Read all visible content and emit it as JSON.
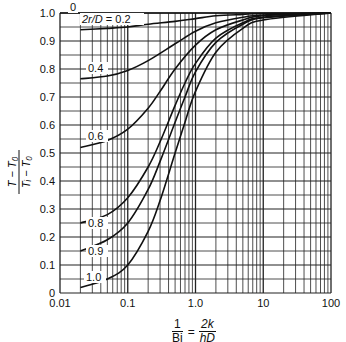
{
  "chart_data": {
    "type": "line",
    "title": "",
    "xlabel": "1/Bi = 2k/hD",
    "ylabel": "(T - T0)/(Ti - T0)",
    "xscale": "log",
    "xlim": [
      0.01,
      100
    ],
    "ylim": [
      0,
      1.0
    ],
    "grid": true,
    "legend": "inline curve labels",
    "x_tick_labels": [
      "0.01",
      "0.1",
      "1.0",
      "10",
      "100"
    ],
    "y_tick_labels": [
      "0",
      "0.1",
      "0.2",
      "0.3",
      "0.4",
      "0.5",
      "0.6",
      "0.7",
      "0.8",
      "0.9",
      "1.0"
    ],
    "series_parameter": "2r/D",
    "series": [
      {
        "name": "0",
        "label": "0",
        "x": [
          0.01,
          100
        ],
        "y": [
          1.0,
          1.0
        ]
      },
      {
        "name": "0.2",
        "label": "2r/D = 0.2",
        "x": [
          0.02,
          0.05,
          0.1,
          0.2,
          0.5,
          1,
          2,
          5,
          10,
          100
        ],
        "y": [
          0.94,
          0.945,
          0.95,
          0.96,
          0.97,
          0.98,
          0.99,
          0.995,
          0.998,
          1.0
        ]
      },
      {
        "name": "0.4",
        "label": "0.4",
        "x": [
          0.02,
          0.05,
          0.1,
          0.2,
          0.5,
          1,
          2,
          5,
          10,
          100
        ],
        "y": [
          0.765,
          0.775,
          0.795,
          0.83,
          0.89,
          0.935,
          0.965,
          0.985,
          0.993,
          1.0
        ]
      },
      {
        "name": "0.6",
        "label": "0.6",
        "x": [
          0.02,
          0.05,
          0.1,
          0.2,
          0.3,
          0.5,
          1,
          2,
          5,
          10,
          100
        ],
        "y": [
          0.52,
          0.545,
          0.585,
          0.66,
          0.72,
          0.8,
          0.885,
          0.94,
          0.975,
          0.99,
          1.0
        ]
      },
      {
        "name": "0.8",
        "label": "0.8",
        "x": [
          0.02,
          0.05,
          0.1,
          0.2,
          0.3,
          0.5,
          0.7,
          1,
          2,
          5,
          10,
          100
        ],
        "y": [
          0.25,
          0.28,
          0.34,
          0.45,
          0.54,
          0.67,
          0.75,
          0.82,
          0.91,
          0.965,
          0.985,
          1.0
        ]
      },
      {
        "name": "0.9",
        "label": "0.9",
        "x": [
          0.02,
          0.05,
          0.1,
          0.2,
          0.3,
          0.5,
          0.7,
          1,
          2,
          5,
          10,
          100
        ],
        "y": [
          0.15,
          0.19,
          0.25,
          0.37,
          0.47,
          0.61,
          0.7,
          0.79,
          0.895,
          0.96,
          0.983,
          1.0
        ]
      },
      {
        "name": "1.0",
        "label": "1.0",
        "x": [
          0.02,
          0.05,
          0.1,
          0.2,
          0.3,
          0.5,
          0.7,
          1,
          2,
          5,
          10,
          100
        ],
        "y": [
          0.02,
          0.05,
          0.1,
          0.22,
          0.33,
          0.5,
          0.61,
          0.72,
          0.86,
          0.945,
          0.975,
          1.0
        ]
      }
    ]
  },
  "axes": {
    "y_title_num": "T − T₀",
    "y_title_den": "Tᵢ − T₀",
    "x_title_left_num": "1",
    "x_title_left_den": "Bi",
    "x_title_eq": "=",
    "x_title_right_num": "2k",
    "x_title_right_den": "hD"
  },
  "style": {
    "line_color": "#111111",
    "grid_color": "#222222",
    "background": "#ffffff"
  }
}
